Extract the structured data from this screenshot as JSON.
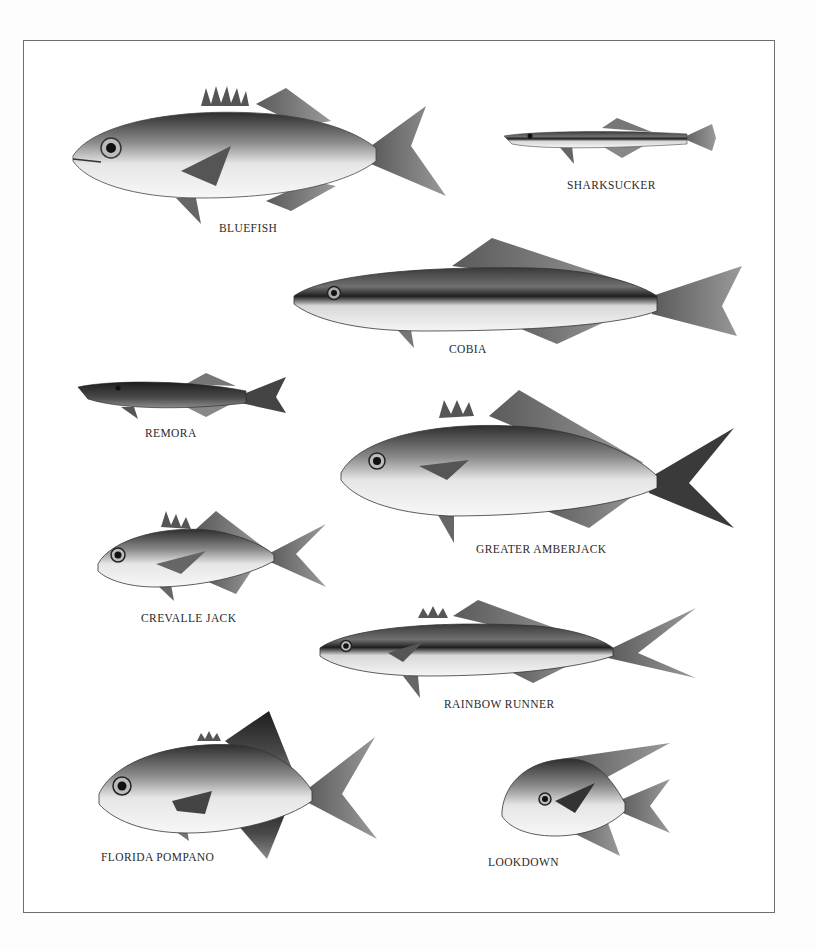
{
  "plate": {
    "border_color": "#6f6f6f",
    "background": "#ffffff"
  },
  "species": [
    {
      "id": "bluefish",
      "label": "BLUEFISH"
    },
    {
      "id": "sharksucker",
      "label": "SHARKSUCKER"
    },
    {
      "id": "cobia",
      "label": "COBIA"
    },
    {
      "id": "remora",
      "label": "REMORA"
    },
    {
      "id": "greater-amberjack",
      "label": "GREATER AMBERJACK"
    },
    {
      "id": "crevalle-jack",
      "label": "CREVALLE JACK"
    },
    {
      "id": "rainbow-runner",
      "label": "RAINBOW RUNNER"
    },
    {
      "id": "florida-pompano",
      "label": "FLORIDA POMPANO"
    },
    {
      "id": "lookdown",
      "label": "LOOKDOWN"
    }
  ]
}
